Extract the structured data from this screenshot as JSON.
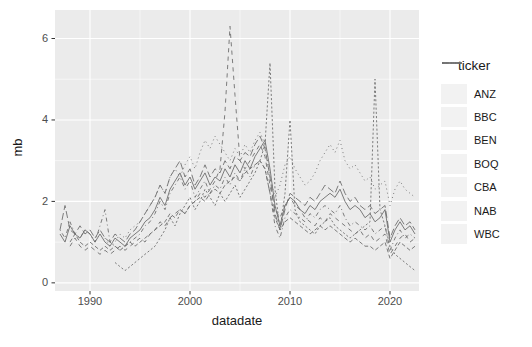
{
  "chart_data": {
    "type": "line",
    "title": "",
    "xlabel": "datadate",
    "ylabel": "mb",
    "legend_title": "ticker",
    "legend_position": "right",
    "grid": "on",
    "x_ticks": [
      1990,
      2000,
      2010,
      2020
    ],
    "x_minor_ticks": [
      1995,
      2005,
      2015
    ],
    "x_tick_labels": [
      "1990",
      "2000",
      "2010",
      "2020"
    ],
    "y_ticks": [
      0,
      2,
      4,
      6
    ],
    "y_minor_ticks": [
      1,
      3,
      5
    ],
    "y_tick_labels": [
      "0",
      "2",
      "4",
      "6"
    ],
    "xlim": [
      1986.5,
      2022.9
    ],
    "ylim": [
      -0.2,
      6.7
    ],
    "colors": {
      "line": "#6e6e6e",
      "panel_bg": "#ebebeb",
      "grid": "#ffffff",
      "axis_text": "#4d4d4d",
      "tick_mark": "#333333",
      "legend_key_bg": "#f2f2f2"
    },
    "series": [
      {
        "name": "ANZ",
        "linetype": "solid",
        "start": 1987.0,
        "step": 0.5,
        "values": [
          1.2,
          1.0,
          1.4,
          1.2,
          1.1,
          1.3,
          1.2,
          1.0,
          1.2,
          1.0,
          0.9,
          1.1,
          1.0,
          0.9,
          1.1,
          1.2,
          1.3,
          1.5,
          1.6,
          1.8,
          2.1,
          1.9,
          2.3,
          2.5,
          2.7,
          2.4,
          2.6,
          2.3,
          2.5,
          2.7,
          2.4,
          2.6,
          2.5,
          2.8,
          2.6,
          2.9,
          2.7,
          3.0,
          2.8,
          3.1,
          3.3,
          3.5,
          2.8,
          1.9,
          1.4,
          1.9,
          2.1,
          2.0,
          1.8,
          1.7,
          1.9,
          1.8,
          2.0,
          2.1,
          2.2,
          2.1,
          2.3,
          2.0,
          1.8,
          1.9,
          1.8,
          1.6,
          1.7,
          1.5,
          1.6,
          1.8,
          1.0,
          1.3,
          1.5,
          1.3,
          1.4,
          1.2
        ]
      },
      {
        "name": "BBC",
        "linetype": "22",
        "start": 1992.5,
        "step": 0.5,
        "values": [
          0.5,
          0.4,
          0.3,
          0.4,
          0.5,
          0.6,
          0.7,
          0.8,
          0.9,
          1.1,
          1.3,
          1.6,
          1.4,
          1.7,
          1.9,
          2.1,
          1.8,
          2.0,
          2.3,
          2.1,
          1.9,
          2.2,
          2.0,
          2.2,
          2.4,
          2.1,
          2.3,
          2.5,
          2.7,
          3.0,
          3.4,
          5.4,
          2.3,
          1.3,
          2.2,
          4.0,
          1.8,
          1.5,
          1.4,
          1.3,
          1.2,
          1.4,
          1.5,
          1.6,
          1.4,
          1.3,
          1.2,
          1.1,
          1.2,
          1.3,
          1.4,
          1.5,
          5.0,
          1.8,
          1.4,
          0.9,
          0.7,
          0.6,
          0.5,
          0.4,
          0.3
        ]
      },
      {
        "name": "BEN",
        "linetype": "42",
        "start": 1988.0,
        "step": 0.5,
        "values": [
          1.0,
          1.2,
          1.0,
          0.9,
          1.0,
          0.9,
          0.8,
          0.9,
          0.8,
          0.9,
          0.8,
          0.9,
          1.0,
          0.9,
          1.0,
          1.1,
          1.2,
          1.3,
          1.4,
          1.5,
          1.7,
          1.6,
          1.8,
          1.7,
          1.9,
          2.0,
          2.1,
          2.0,
          2.2,
          2.3,
          2.2,
          2.4,
          2.5,
          2.6,
          2.5,
          2.7,
          2.8,
          2.9,
          3.0,
          2.8,
          2.2,
          1.6,
          1.3,
          1.5,
          1.6,
          1.5,
          1.4,
          1.3,
          1.2,
          1.3,
          1.4,
          1.3,
          1.4,
          1.3,
          1.2,
          1.1,
          1.0,
          1.1,
          1.0,
          0.9,
          0.9,
          0.8,
          0.9,
          1.0,
          0.6,
          0.8,
          1.0,
          0.9,
          0.8,
          0.9
        ]
      },
      {
        "name": "BOQ",
        "linetype": "44",
        "start": 1988.0,
        "step": 0.5,
        "values": [
          0.9,
          1.1,
          0.9,
          0.8,
          0.9,
          0.8,
          0.7,
          0.8,
          0.7,
          0.8,
          0.9,
          0.8,
          0.9,
          1.0,
          1.1,
          1.0,
          1.2,
          1.3,
          1.5,
          1.4,
          1.6,
          1.7,
          1.8,
          1.7,
          1.9,
          2.0,
          2.2,
          2.1,
          2.3,
          2.5,
          2.8,
          4.2,
          6.3,
          4.6,
          3.0,
          2.8,
          3.0,
          3.2,
          3.4,
          3.1,
          2.4,
          1.8,
          1.6,
          1.9,
          2.1,
          1.9,
          1.8,
          1.6,
          1.5,
          1.4,
          1.6,
          1.5,
          1.7,
          1.6,
          1.5,
          1.4,
          1.3,
          1.2,
          1.3,
          1.1,
          1.2,
          1.0,
          1.1,
          1.2,
          0.7,
          0.9,
          1.1,
          1.2,
          1.0,
          1.1
        ]
      },
      {
        "name": "CBA",
        "linetype": "13",
        "start": 1991.5,
        "step": 0.5,
        "values": [
          1.1,
          0.9,
          1.0,
          1.2,
          1.1,
          1.3,
          1.4,
          1.5,
          1.7,
          1.9,
          2.1,
          2.4,
          2.2,
          2.6,
          2.8,
          2.6,
          2.9,
          3.1,
          2.8,
          3.2,
          3.5,
          3.3,
          3.6,
          3.4,
          3.2,
          3.0,
          3.3,
          3.1,
          3.4,
          3.2,
          3.5,
          3.7,
          3.4,
          2.6,
          2.1,
          2.4,
          2.9,
          3.1,
          2.8,
          2.6,
          2.4,
          2.5,
          2.7,
          3.0,
          3.2,
          3.4,
          3.2,
          3.5,
          3.0,
          2.8,
          2.9,
          2.7,
          2.5,
          2.6,
          2.3,
          2.4,
          2.5,
          1.9,
          2.3,
          2.5,
          2.3,
          2.2,
          2.1
        ]
      },
      {
        "name": "NAB",
        "linetype": "1343",
        "start": 1987.0,
        "step": 0.5,
        "values": [
          1.3,
          1.1,
          1.5,
          1.2,
          1.1,
          1.3,
          1.2,
          1.0,
          1.4,
          1.8,
          1.0,
          0.9,
          0.8,
          0.9,
          1.0,
          1.1,
          1.2,
          1.4,
          1.5,
          1.7,
          2.0,
          1.8,
          2.2,
          2.4,
          2.6,
          2.3,
          2.5,
          2.1,
          2.3,
          2.5,
          2.2,
          2.4,
          2.3,
          2.6,
          2.4,
          2.7,
          2.5,
          2.8,
          2.6,
          2.9,
          3.0,
          2.8,
          2.2,
          1.4,
          1.1,
          1.6,
          1.8,
          1.7,
          1.6,
          1.5,
          1.7,
          1.6,
          1.8,
          1.9,
          1.8,
          1.7,
          1.9,
          1.6,
          1.4,
          1.5,
          1.4,
          1.3,
          1.4,
          1.2,
          1.3,
          1.4,
          0.8,
          1.1,
          1.3,
          1.1,
          1.2,
          1.1
        ]
      },
      {
        "name": "WBC",
        "linetype": "73",
        "start": 1987.0,
        "step": 0.5,
        "values": [
          1.3,
          1.9,
          1.3,
          1.2,
          1.4,
          1.2,
          1.3,
          1.1,
          1.3,
          1.1,
          1.0,
          1.2,
          1.1,
          1.0,
          1.2,
          1.3,
          1.5,
          1.7,
          1.9,
          2.1,
          2.4,
          2.2,
          2.6,
          2.8,
          3.0,
          2.6,
          2.8,
          2.4,
          2.6,
          2.9,
          2.6,
          2.8,
          2.7,
          3.0,
          2.8,
          3.1,
          3.0,
          3.2,
          3.1,
          3.4,
          3.6,
          3.3,
          2.6,
          1.7,
          1.3,
          1.8,
          2.2,
          2.1,
          2.0,
          1.9,
          2.1,
          2.0,
          2.2,
          2.4,
          2.3,
          2.2,
          2.5,
          2.2,
          2.0,
          2.1,
          1.9,
          1.8,
          1.9,
          1.7,
          1.8,
          1.9,
          1.1,
          1.4,
          1.6,
          1.4,
          1.5,
          1.3
        ]
      }
    ]
  }
}
